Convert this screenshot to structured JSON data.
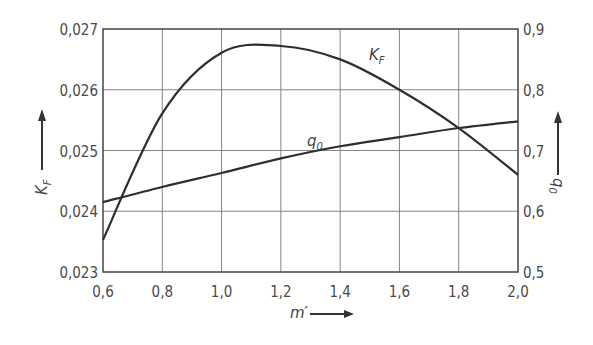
{
  "chart_data": {
    "type": "line",
    "title": "",
    "xlabel": "m′",
    "ylabel_left": "K_F",
    "ylabel_right": "q_0",
    "xlim": [
      0.6,
      2.0
    ],
    "ylim_left": [
      0.023,
      0.027
    ],
    "ylim_right": [
      0.5,
      0.9
    ],
    "grid": true,
    "x_ticks": [
      "0,6",
      "0,8",
      "1,0",
      "1,2",
      "1,4",
      "1,6",
      "1,8",
      "2,0"
    ],
    "y_ticks_left": [
      "0,023",
      "0,024",
      "0,025",
      "0,026",
      "0,027"
    ],
    "y_ticks_right": [
      "0,5",
      "0,6",
      "0,7",
      "0,8",
      "0,9"
    ],
    "x": [
      0.6,
      0.8,
      1.0,
      1.2,
      1.4,
      1.6,
      1.8,
      2.0
    ],
    "series": [
      {
        "name": "K_F",
        "axis": "left",
        "values": [
          0.02353,
          0.02561,
          0.02661,
          0.02672,
          0.0265,
          0.026,
          0.02537,
          0.0246
        ],
        "label_text": "K",
        "label_sub": "F"
      },
      {
        "name": "q_0",
        "axis": "right",
        "values": [
          0.615,
          0.64,
          0.663,
          0.687,
          0.707,
          0.722,
          0.737,
          0.748
        ],
        "label_text": "q",
        "label_sub": "0"
      }
    ],
    "legend": "inline curve labels"
  },
  "axis_labels": {
    "x": "m′",
    "left_main": "K",
    "left_sub": "F",
    "right_main": "q",
    "right_sub": "0"
  }
}
